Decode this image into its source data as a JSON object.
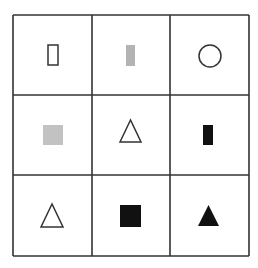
{
  "puzzle": {
    "rows": 3,
    "cols": 3,
    "grid_line_color": "#333333",
    "grid": {
      "x_lines": [
        13,
        92,
        170,
        249
      ],
      "y_lines": [
        15,
        95,
        175,
        256
      ]
    },
    "cells": [
      {
        "row": 0,
        "col": 0,
        "shape": "rectangle",
        "fill": "outline",
        "fill_color": "#ffffff",
        "stroke": "#333333",
        "x": 48,
        "y": 45,
        "w": 10,
        "h": 20
      },
      {
        "row": 0,
        "col": 1,
        "shape": "rectangle",
        "fill": "gray",
        "fill_color": "#b3b3b3",
        "stroke": "none",
        "x": 126,
        "y": 45,
        "w": 9,
        "h": 21
      },
      {
        "row": 0,
        "col": 2,
        "shape": "circle",
        "fill": "outline",
        "fill_color": "#ffffff",
        "stroke": "#333333",
        "cx": 210,
        "cy": 56,
        "r": 11
      },
      {
        "row": 1,
        "col": 0,
        "shape": "square",
        "fill": "gray",
        "fill_color": "#c2c2c2",
        "stroke": "none",
        "x": 43,
        "y": 125,
        "w": 20,
        "h": 20
      },
      {
        "row": 1,
        "col": 1,
        "shape": "triangle",
        "fill": "outline",
        "fill_color": "#ffffff",
        "stroke": "#333333",
        "points": "130.5,120 120,142 141,142"
      },
      {
        "row": 1,
        "col": 2,
        "shape": "rectangle",
        "fill": "black",
        "fill_color": "#111111",
        "stroke": "none",
        "x": 203,
        "y": 125,
        "w": 10,
        "h": 20
      },
      {
        "row": 2,
        "col": 0,
        "shape": "triangle",
        "fill": "outline",
        "fill_color": "#ffffff",
        "stroke": "#333333",
        "points": "52,204 41,227 63,227"
      },
      {
        "row": 2,
        "col": 1,
        "shape": "square",
        "fill": "black",
        "fill_color": "#111111",
        "stroke": "none",
        "x": 120,
        "y": 205,
        "w": 21,
        "h": 22
      },
      {
        "row": 2,
        "col": 2,
        "shape": "triangle",
        "fill": "black",
        "fill_color": "#111111",
        "stroke": "none",
        "points": "208.5,205 198,226 219,226"
      }
    ]
  }
}
